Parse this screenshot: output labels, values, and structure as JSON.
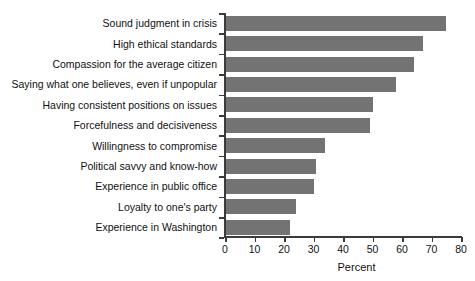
{
  "chart_data": {
    "type": "bar",
    "orientation": "horizontal",
    "title": "",
    "xlabel": "Percent",
    "ylabel": "",
    "xlim": [
      0,
      80
    ],
    "xticks": [
      0,
      10,
      20,
      30,
      40,
      50,
      60,
      70,
      80
    ],
    "grid": false,
    "bar_color": "#737373",
    "axis_color": "#3b3b3b",
    "categories": [
      "Sound judgment in crisis",
      "High ethical standards",
      "Compassion for the average citizen",
      "Saying what one believes, even if unpopular",
      "Having consistent positions on issues",
      "Forcefulness and decisiveness",
      "Willingness to compromise",
      "Political savvy and know-how",
      "Experience in public office",
      "Loyalty to one's party",
      "Experience in Washington"
    ],
    "values": [
      75,
      67,
      64,
      58,
      50,
      49,
      34,
      31,
      30,
      24,
      22
    ]
  }
}
